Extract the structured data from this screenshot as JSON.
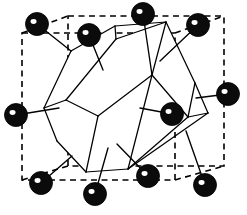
{
  "figure": {
    "caption": "",
    "width": 247,
    "height": 215,
    "background_color": "#ffffff"
  },
  "style": {
    "line_color": "#000000",
    "atom_fill": "#0b0b0b",
    "atom_highlight": "#ffffff",
    "face_fill": "#ffffff",
    "cell_dash_pattern": "6 4.5",
    "cell_stroke_width": 1.6,
    "polyhedron_stroke_width": 1.25,
    "bond_stroke_width": 1.35
  },
  "unit_cell": {
    "name": "dashed-cubic-unit-cell",
    "style": "dashed",
    "front_face": [
      {
        "x": 22,
        "y": 33
      },
      {
        "x": 175,
        "y": 33
      },
      {
        "x": 175,
        "y": 180
      },
      {
        "x": 22,
        "y": 180
      }
    ],
    "back_face": [
      {
        "x": 68,
        "y": 16
      },
      {
        "x": 224,
        "y": 16
      },
      {
        "x": 224,
        "y": 166
      },
      {
        "x": 68,
        "y": 166
      }
    ],
    "connectors": [
      [
        {
          "x": 22,
          "y": 33
        },
        {
          "x": 68,
          "y": 16
        }
      ],
      [
        {
          "x": 175,
          "y": 33
        },
        {
          "x": 224,
          "y": 16
        }
      ],
      [
        {
          "x": 175,
          "y": 180
        },
        {
          "x": 224,
          "y": 166
        }
      ],
      [
        {
          "x": 22,
          "y": 180
        },
        {
          "x": 68,
          "y": 166
        }
      ]
    ]
  },
  "polyhedron": {
    "name": "coordination-polyhedron",
    "description": "Distorted cuboctahedral / rhombic polyhedron drawn with solid white faces and black edges",
    "faces": [
      {
        "name": "face-upper-left",
        "points": [
          {
            "x": 44,
            "y": 108
          },
          {
            "x": 71,
            "y": 51
          },
          {
            "x": 115,
            "y": 26
          },
          {
            "x": 116,
            "y": 39
          },
          {
            "x": 66,
            "y": 100
          }
        ]
      },
      {
        "name": "face-top",
        "points": [
          {
            "x": 66,
            "y": 100
          },
          {
            "x": 116,
            "y": 39
          },
          {
            "x": 166,
            "y": 22
          },
          {
            "x": 152,
            "y": 75
          },
          {
            "x": 98,
            "y": 116
          }
        ]
      },
      {
        "name": "face-right-upper",
        "points": [
          {
            "x": 166,
            "y": 22
          },
          {
            "x": 195,
            "y": 83
          },
          {
            "x": 188,
            "y": 117
          },
          {
            "x": 152,
            "y": 75
          }
        ]
      },
      {
        "name": "face-left-lower",
        "points": [
          {
            "x": 44,
            "y": 108
          },
          {
            "x": 66,
            "y": 100
          },
          {
            "x": 98,
            "y": 116
          },
          {
            "x": 86,
            "y": 172
          },
          {
            "x": 57,
            "y": 141
          }
        ]
      },
      {
        "name": "face-bottom",
        "points": [
          {
            "x": 98,
            "y": 116
          },
          {
            "x": 152,
            "y": 75
          },
          {
            "x": 188,
            "y": 117
          },
          {
            "x": 128,
            "y": 169
          },
          {
            "x": 86,
            "y": 172
          }
        ]
      }
    ],
    "edges": [
      [
        {
          "x": 44,
          "y": 108
        },
        {
          "x": 71,
          "y": 51
        }
      ],
      [
        {
          "x": 71,
          "y": 51
        },
        {
          "x": 115,
          "y": 26
        }
      ],
      [
        {
          "x": 115,
          "y": 26
        },
        {
          "x": 116,
          "y": 39
        }
      ],
      [
        {
          "x": 116,
          "y": 39
        },
        {
          "x": 66,
          "y": 100
        }
      ],
      [
        {
          "x": 66,
          "y": 100
        },
        {
          "x": 44,
          "y": 108
        }
      ],
      [
        {
          "x": 115,
          "y": 26
        },
        {
          "x": 166,
          "y": 22
        }
      ],
      [
        {
          "x": 116,
          "y": 39
        },
        {
          "x": 166,
          "y": 22
        }
      ],
      [
        {
          "x": 166,
          "y": 22
        },
        {
          "x": 152,
          "y": 75
        }
      ],
      [
        {
          "x": 152,
          "y": 75
        },
        {
          "x": 98,
          "y": 116
        }
      ],
      [
        {
          "x": 98,
          "y": 116
        },
        {
          "x": 66,
          "y": 100
        }
      ],
      [
        {
          "x": 166,
          "y": 22
        },
        {
          "x": 195,
          "y": 83
        }
      ],
      [
        {
          "x": 195,
          "y": 83
        },
        {
          "x": 188,
          "y": 117
        }
      ],
      [
        {
          "x": 188,
          "y": 117
        },
        {
          "x": 152,
          "y": 75
        }
      ],
      [
        {
          "x": 44,
          "y": 108
        },
        {
          "x": 57,
          "y": 141
        }
      ],
      [
        {
          "x": 57,
          "y": 141
        },
        {
          "x": 86,
          "y": 172
        }
      ],
      [
        {
          "x": 86,
          "y": 172
        },
        {
          "x": 98,
          "y": 116
        }
      ],
      [
        {
          "x": 86,
          "y": 172
        },
        {
          "x": 128,
          "y": 169
        }
      ],
      [
        {
          "x": 128,
          "y": 169
        },
        {
          "x": 188,
          "y": 117
        }
      ],
      [
        {
          "x": 128,
          "y": 169
        },
        {
          "x": 152,
          "y": 75
        }
      ],
      [
        {
          "x": 195,
          "y": 83
        },
        {
          "x": 208,
          "y": 113
        }
      ],
      [
        {
          "x": 208,
          "y": 113
        },
        {
          "x": 188,
          "y": 117
        }
      ],
      [
        {
          "x": 208,
          "y": 113
        },
        {
          "x": 128,
          "y": 169
        }
      ]
    ]
  },
  "atoms": [
    {
      "id": "atom-top-left-back",
      "label": "corner atom",
      "cx": 37,
      "cy": 24,
      "r": 11.5
    },
    {
      "id": "atom-top-left-front",
      "label": "corner atom",
      "cx": 89,
      "cy": 35,
      "r": 11.5
    },
    {
      "id": "atom-top-center",
      "label": "face-centre atom",
      "cx": 143,
      "cy": 14,
      "r": 11.5
    },
    {
      "id": "atom-top-right",
      "label": "corner atom",
      "cx": 198,
      "cy": 25,
      "r": 11.5
    },
    {
      "id": "atom-left-middle",
      "label": "face-centre atom",
      "cx": 16,
      "cy": 115,
      "r": 11.5
    },
    {
      "id": "atom-right-middle",
      "label": "face-centre atom",
      "cx": 228,
      "cy": 94,
      "r": 11.5
    },
    {
      "id": "atom-centre-right",
      "label": "face-centre atom",
      "cx": 172,
      "cy": 114,
      "r": 11.5
    },
    {
      "id": "atom-bottom-left",
      "label": "corner atom",
      "cx": 41,
      "cy": 183,
      "r": 11.5
    },
    {
      "id": "atom-bottom-centre",
      "label": "face-centre atom",
      "cx": 95,
      "cy": 194,
      "r": 11.5
    },
    {
      "id": "atom-bottom-right-in",
      "label": "corner atom",
      "cx": 148,
      "cy": 176,
      "r": 11.5
    },
    {
      "id": "atom-bottom-right",
      "label": "corner atom",
      "cx": 205,
      "cy": 185,
      "r": 11.5
    }
  ],
  "bonds": [
    {
      "name": "bond-top-left-back",
      "from": {
        "x": 37,
        "y": 24
      },
      "to": {
        "x": 71,
        "y": 51
      }
    },
    {
      "name": "bond-top-left-front",
      "from": {
        "x": 89,
        "y": 35
      },
      "to": {
        "x": 103,
        "y": 70
      }
    },
    {
      "name": "bond-top-centre",
      "from": {
        "x": 143,
        "y": 14
      },
      "to": {
        "x": 152,
        "y": 75
      }
    },
    {
      "name": "bond-top-right",
      "from": {
        "x": 198,
        "y": 25
      },
      "to": {
        "x": 160,
        "y": 61
      }
    },
    {
      "name": "bond-left-middle",
      "from": {
        "x": 16,
        "y": 115
      },
      "to": {
        "x": 59,
        "y": 108
      }
    },
    {
      "name": "bond-right-middle",
      "from": {
        "x": 228,
        "y": 94
      },
      "to": {
        "x": 196,
        "y": 98
      }
    },
    {
      "name": "bond-centre-right",
      "from": {
        "x": 172,
        "y": 114
      },
      "to": {
        "x": 140,
        "y": 108
      }
    },
    {
      "name": "bond-bottom-left",
      "from": {
        "x": 41,
        "y": 183
      },
      "to": {
        "x": 72,
        "y": 156
      }
    },
    {
      "name": "bond-bottom-centre",
      "from": {
        "x": 95,
        "y": 194
      },
      "to": {
        "x": 108,
        "y": 148
      }
    },
    {
      "name": "bond-bottom-right-in",
      "from": {
        "x": 148,
        "y": 176
      },
      "to": {
        "x": 117,
        "y": 144
      }
    },
    {
      "name": "bond-bottom-right",
      "from": {
        "x": 205,
        "y": 185
      },
      "to": {
        "x": 186,
        "y": 131
      }
    }
  ]
}
